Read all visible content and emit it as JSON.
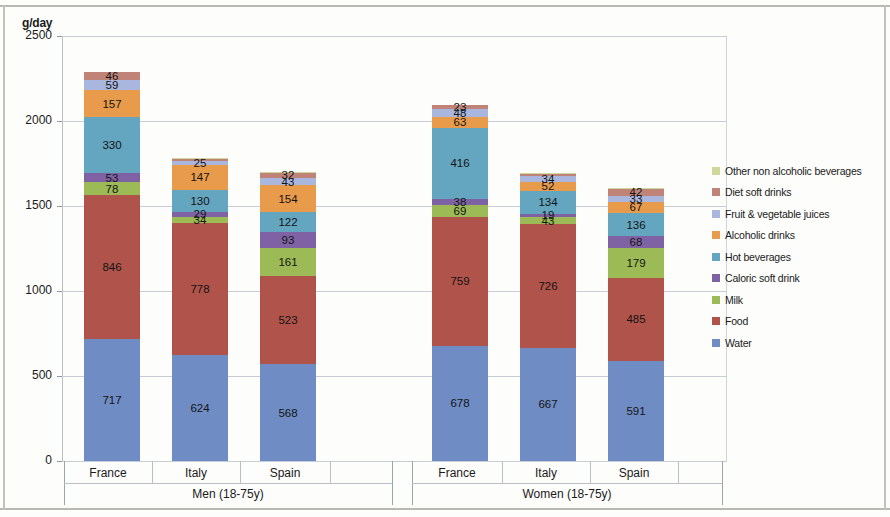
{
  "chart_data": {
    "type": "bar",
    "subtype": "stacked-bar",
    "title": "",
    "xlabel": "",
    "ylabel": "g/day",
    "ylim": [
      0,
      2500
    ],
    "yticks": [
      0,
      500,
      1000,
      1500,
      2000,
      2500
    ],
    "ytick_labels": [
      "0",
      "500",
      "1000",
      "1500",
      "2000",
      "2500"
    ],
    "grid": true,
    "legend_position": "right",
    "categories": [
      "France",
      "Italy",
      "Spain",
      "France",
      "Italy",
      "Spain"
    ],
    "groups": [
      {
        "label": "Men (18-75y)",
        "categories": [
          "France",
          "Italy",
          "Spain"
        ]
      },
      {
        "label": "Women (18-75y)",
        "categories": [
          "France",
          "Italy",
          "Spain"
        ]
      }
    ],
    "series": [
      {
        "name": "Water",
        "color": "#6f8cc4",
        "values": [
          717,
          624,
          568,
          678,
          667,
          591
        ]
      },
      {
        "name": "Food",
        "color": "#b0534a",
        "values": [
          846,
          778,
          523,
          759,
          726,
          485
        ]
      },
      {
        "name": "Milk",
        "color": "#9cba55",
        "values": [
          78,
          34,
          161,
          69,
          43,
          179
        ]
      },
      {
        "name": "Caloric soft drink",
        "color": "#7f62a3",
        "values": [
          53,
          29,
          93,
          38,
          19,
          68
        ]
      },
      {
        "name": "Hot beverages",
        "color": "#64a5c0",
        "values": [
          330,
          130,
          122,
          416,
          134,
          136
        ]
      },
      {
        "name": "Alcoholic drinks",
        "color": "#e89b4b",
        "values": [
          157,
          147,
          154,
          63,
          52,
          67
        ]
      },
      {
        "name": "Fruit & vegetable juices",
        "color": "#a9b6dd",
        "values": [
          59,
          25,
          43,
          48,
          34,
          33
        ]
      },
      {
        "name": "Diet soft drinks",
        "color": "#c08378",
        "values": [
          46,
          12,
          32,
          23,
          14,
          42
        ]
      },
      {
        "name": "Other non alcoholic beverages",
        "color": "#cfd79a",
        "values": [
          4,
          3,
          4,
          3,
          3,
          4
        ]
      }
    ],
    "legend_entries": [
      {
        "label": "Other non alcoholic beverages",
        "color": "#cfd79a"
      },
      {
        "label": "Diet soft drinks",
        "color": "#c08378"
      },
      {
        "label": "Fruit & vegetable juices",
        "color": "#a9b6dd"
      },
      {
        "label": "Alcoholic drinks",
        "color": "#e89b4b"
      },
      {
        "label": "Hot beverages",
        "color": "#64a5c0"
      },
      {
        "label": "Caloric soft drink",
        "color": "#7f62a3"
      },
      {
        "label": "Milk",
        "color": "#9cba55"
      },
      {
        "label": "Food",
        "color": "#b0534a"
      },
      {
        "label": "Water",
        "color": "#6f8cc4"
      }
    ],
    "bar_labels": [
      {
        "category": "France",
        "group": "Men (18-75y)",
        "labels": [
          "717",
          "846",
          "78",
          "53",
          "330",
          "157",
          "59",
          "46"
        ]
      },
      {
        "category": "Italy",
        "group": "Men (18-75y)",
        "labels": [
          "624",
          "778",
          "34",
          "29",
          "130",
          "147",
          "25"
        ]
      },
      {
        "category": "Spain",
        "group": "Men (18-75y)",
        "labels": [
          "568",
          "523",
          "161",
          "93",
          "122",
          "154",
          "43",
          "32"
        ]
      },
      {
        "category": "France",
        "group": "Women (18-75y)",
        "labels": [
          "678",
          "759",
          "69",
          "38",
          "416",
          "63",
          "48",
          "23"
        ]
      },
      {
        "category": "Italy",
        "group": "Women (18-75y)",
        "labels": [
          "667",
          "726",
          "43",
          "19",
          "134",
          "52",
          "34"
        ]
      },
      {
        "category": "Spain",
        "group": "Women (18-75y)",
        "labels": [
          "591",
          "485",
          "179",
          "68",
          "136",
          "67",
          "33",
          "42"
        ]
      }
    ]
  }
}
